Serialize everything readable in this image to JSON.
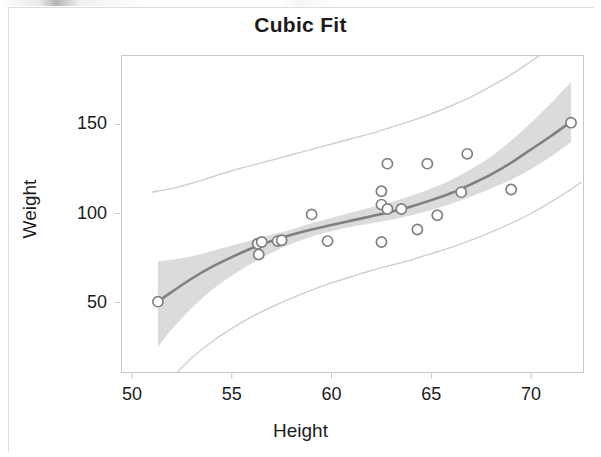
{
  "figure": {
    "title": "Cubic Fit",
    "background_color": "#ffffff",
    "frame_color": "#c8c8c8"
  },
  "axis_titles": {
    "x": "Height",
    "y": "Weight"
  },
  "colors": {
    "fit_curve": "#808080",
    "confidence_band": "#d9d9d9",
    "prediction_limit_line": "#cfcfcf",
    "marker_stroke": "#808080",
    "marker_fill": "#ffffff",
    "text": "#1b1b1b",
    "frame": "#c8c8c8"
  },
  "chart_data": {
    "type": "scatter",
    "title": "Cubic Fit",
    "xlabel": "Height",
    "ylabel": "Weight",
    "xlim": [
      49.45,
      72.6
    ],
    "ylim": [
      11.0,
      189.0
    ],
    "grid": false,
    "legend_position": "none",
    "xticks": [
      50,
      55,
      60,
      65,
      70
    ],
    "yticks": [
      50,
      100,
      150
    ],
    "series": [
      {
        "name": "Observations",
        "type": "scatter",
        "marker": "open-circle",
        "points": [
          {
            "x": 51.3,
            "y": 50.5
          },
          {
            "x": 56.3,
            "y": 83.0
          },
          {
            "x": 56.35,
            "y": 77.0
          },
          {
            "x": 56.5,
            "y": 84.0
          },
          {
            "x": 57.3,
            "y": 84.5
          },
          {
            "x": 57.5,
            "y": 85.0
          },
          {
            "x": 59.0,
            "y": 99.5
          },
          {
            "x": 59.8,
            "y": 84.5
          },
          {
            "x": 62.5,
            "y": 112.5
          },
          {
            "x": 62.5,
            "y": 84.0
          },
          {
            "x": 62.5,
            "y": 105.0
          },
          {
            "x": 62.8,
            "y": 102.5
          },
          {
            "x": 62.8,
            "y": 128.0
          },
          {
            "x": 63.5,
            "y": 102.5
          },
          {
            "x": 64.3,
            "y": 91.0
          },
          {
            "x": 64.8,
            "y": 128.0
          },
          {
            "x": 65.3,
            "y": 99.0
          },
          {
            "x": 66.5,
            "y": 112.0
          },
          {
            "x": 66.8,
            "y": 133.5
          },
          {
            "x": 69.0,
            "y": 113.5
          },
          {
            "x": 72.0,
            "y": 151.0
          }
        ]
      },
      {
        "name": "Cubic fit",
        "type": "line",
        "points": [
          {
            "x": 51.3,
            "y": 50.5
          },
          {
            "x": 52.0,
            "y": 56.0
          },
          {
            "x": 53.0,
            "y": 63.5
          },
          {
            "x": 54.0,
            "y": 70.0
          },
          {
            "x": 55.0,
            "y": 75.5
          },
          {
            "x": 56.0,
            "y": 80.5
          },
          {
            "x": 57.0,
            "y": 84.5
          },
          {
            "x": 58.0,
            "y": 88.0
          },
          {
            "x": 59.0,
            "y": 91.0
          },
          {
            "x": 60.0,
            "y": 93.5
          },
          {
            "x": 61.0,
            "y": 96.0
          },
          {
            "x": 62.0,
            "y": 98.5
          },
          {
            "x": 63.0,
            "y": 101.0
          },
          {
            "x": 64.0,
            "y": 104.0
          },
          {
            "x": 65.0,
            "y": 107.5
          },
          {
            "x": 66.0,
            "y": 111.5
          },
          {
            "x": 67.0,
            "y": 116.5
          },
          {
            "x": 68.0,
            "y": 122.0
          },
          {
            "x": 69.0,
            "y": 128.5
          },
          {
            "x": 70.0,
            "y": 136.0
          },
          {
            "x": 71.0,
            "y": 143.5
          },
          {
            "x": 72.0,
            "y": 151.5
          }
        ]
      },
      {
        "name": "95% confidence band upper",
        "type": "band-edge",
        "points": [
          {
            "x": 51.3,
            "y": 73.0
          },
          {
            "x": 52.0,
            "y": 74.0
          },
          {
            "x": 53.0,
            "y": 76.0
          },
          {
            "x": 54.0,
            "y": 79.0
          },
          {
            "x": 55.0,
            "y": 82.0
          },
          {
            "x": 56.0,
            "y": 85.0
          },
          {
            "x": 57.0,
            "y": 88.0
          },
          {
            "x": 58.0,
            "y": 91.0
          },
          {
            "x": 59.0,
            "y": 94.5
          },
          {
            "x": 60.0,
            "y": 97.5
          },
          {
            "x": 61.0,
            "y": 100.5
          },
          {
            "x": 62.0,
            "y": 103.5
          },
          {
            "x": 63.0,
            "y": 106.5
          },
          {
            "x": 64.0,
            "y": 110.0
          },
          {
            "x": 65.0,
            "y": 114.0
          },
          {
            "x": 66.0,
            "y": 119.0
          },
          {
            "x": 67.0,
            "y": 125.0
          },
          {
            "x": 68.0,
            "y": 132.0
          },
          {
            "x": 69.0,
            "y": 141.0
          },
          {
            "x": 70.0,
            "y": 151.0
          },
          {
            "x": 71.0,
            "y": 162.0
          },
          {
            "x": 72.0,
            "y": 174.0
          }
        ]
      },
      {
        "name": "95% confidence band lower",
        "type": "band-edge",
        "points": [
          {
            "x": 51.3,
            "y": 25.0
          },
          {
            "x": 52.0,
            "y": 35.0
          },
          {
            "x": 53.0,
            "y": 47.0
          },
          {
            "x": 54.0,
            "y": 57.0
          },
          {
            "x": 55.0,
            "y": 65.0
          },
          {
            "x": 56.0,
            "y": 72.0
          },
          {
            "x": 57.0,
            "y": 78.0
          },
          {
            "x": 58.0,
            "y": 83.0
          },
          {
            "x": 59.0,
            "y": 87.0
          },
          {
            "x": 60.0,
            "y": 90.0
          },
          {
            "x": 61.0,
            "y": 92.5
          },
          {
            "x": 62.0,
            "y": 94.5
          },
          {
            "x": 63.0,
            "y": 96.5
          },
          {
            "x": 64.0,
            "y": 99.0
          },
          {
            "x": 65.0,
            "y": 102.0
          },
          {
            "x": 66.0,
            "y": 105.5
          },
          {
            "x": 67.0,
            "y": 109.5
          },
          {
            "x": 68.0,
            "y": 114.0
          },
          {
            "x": 69.0,
            "y": 119.0
          },
          {
            "x": 70.0,
            "y": 125.0
          },
          {
            "x": 71.0,
            "y": 132.0
          },
          {
            "x": 72.0,
            "y": 140.0
          }
        ]
      },
      {
        "name": "95% prediction limit upper",
        "type": "limit-line",
        "points": [
          {
            "x": 51.0,
            "y": 112.0
          },
          {
            "x": 52.0,
            "y": 114.0
          },
          {
            "x": 53.0,
            "y": 117.0
          },
          {
            "x": 54.0,
            "y": 120.5
          },
          {
            "x": 55.0,
            "y": 124.0
          },
          {
            "x": 56.0,
            "y": 127.0
          },
          {
            "x": 57.0,
            "y": 130.0
          },
          {
            "x": 58.0,
            "y": 133.0
          },
          {
            "x": 59.0,
            "y": 136.0
          },
          {
            "x": 60.0,
            "y": 139.0
          },
          {
            "x": 61.0,
            "y": 142.0
          },
          {
            "x": 62.0,
            "y": 145.0
          },
          {
            "x": 63.0,
            "y": 148.5
          },
          {
            "x": 64.0,
            "y": 152.0
          },
          {
            "x": 65.0,
            "y": 156.0
          },
          {
            "x": 66.0,
            "y": 160.5
          },
          {
            "x": 67.0,
            "y": 165.5
          },
          {
            "x": 68.0,
            "y": 171.5
          },
          {
            "x": 69.0,
            "y": 178.0
          },
          {
            "x": 70.0,
            "y": 185.5
          },
          {
            "x": 70.6,
            "y": 190.0
          }
        ]
      },
      {
        "name": "95% prediction limit lower",
        "type": "limit-line",
        "points": [
          {
            "x": 52.1,
            "y": 9.0
          },
          {
            "x": 53.0,
            "y": 19.0
          },
          {
            "x": 54.0,
            "y": 28.0
          },
          {
            "x": 55.0,
            "y": 35.5
          },
          {
            "x": 56.0,
            "y": 42.0
          },
          {
            "x": 57.0,
            "y": 47.5
          },
          {
            "x": 58.0,
            "y": 52.5
          },
          {
            "x": 59.0,
            "y": 57.0
          },
          {
            "x": 60.0,
            "y": 61.0
          },
          {
            "x": 61.0,
            "y": 64.5
          },
          {
            "x": 62.0,
            "y": 68.0
          },
          {
            "x": 63.0,
            "y": 71.0
          },
          {
            "x": 64.0,
            "y": 74.0
          },
          {
            "x": 65.0,
            "y": 77.5
          },
          {
            "x": 66.0,
            "y": 81.0
          },
          {
            "x": 67.0,
            "y": 85.0
          },
          {
            "x": 68.0,
            "y": 89.5
          },
          {
            "x": 69.0,
            "y": 94.5
          },
          {
            "x": 70.0,
            "y": 100.0
          },
          {
            "x": 71.0,
            "y": 106.5
          },
          {
            "x": 72.0,
            "y": 113.5
          },
          {
            "x": 72.5,
            "y": 117.5
          }
        ]
      }
    ]
  }
}
